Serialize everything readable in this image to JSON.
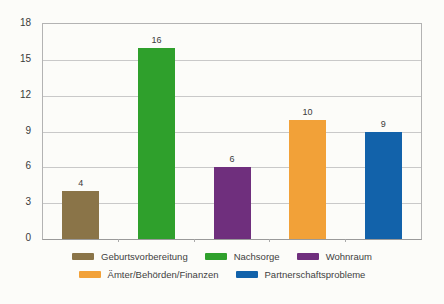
{
  "window": {
    "width": 444,
    "height": 304,
    "background": "#fcfcf9"
  },
  "chart_data": {
    "type": "bar",
    "title": "",
    "xlabel": "",
    "ylabel": "",
    "categories": [
      "Geburtsvorbereitung",
      "Nachsorge",
      "Wohnraum",
      "Ämter/Behörden/Finanzen",
      "Partnerschaftsprobleme"
    ],
    "values": [
      4,
      16,
      6,
      10,
      9
    ],
    "value_labels": [
      "4",
      "16",
      "6",
      "10",
      "9"
    ],
    "bar_colors": [
      "#8a7448",
      "#2fa02c",
      "#6f2f7d",
      "#f2a138",
      "#1262aa"
    ],
    "ylim": [
      0,
      18
    ],
    "yticks": [
      0,
      3,
      6,
      9,
      12,
      15,
      18
    ],
    "grid": true,
    "legend_position": "bottom",
    "legend_rows": [
      [
        0,
        1,
        2
      ],
      [
        3,
        4
      ]
    ],
    "colors": {
      "gridline": "#c9c9c9",
      "plot_border": "#b3b3b3",
      "baseline": "#9a9a9a",
      "tick": "#aaaaaa",
      "axis_text": "#3a3a3a",
      "value_text": "#3a3a3a",
      "legend_text": "#3f3f3f"
    },
    "layout": {
      "plot_left": 42,
      "plot_top": 23,
      "plot_width": 378,
      "plot_height": 215,
      "bar_width": 37
    }
  }
}
